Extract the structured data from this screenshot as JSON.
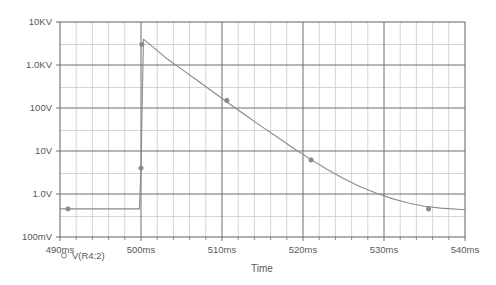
{
  "chart_data": {
    "type": "line",
    "title": "",
    "xlabel": "Time",
    "ylabel": "",
    "yscale": "log",
    "xlim": [
      490,
      540
    ],
    "ylim": [
      0.1,
      10000
    ],
    "grid": true,
    "legend_position": "bottom-left",
    "x_unit": "ms",
    "y_tick_labels": [
      "10KV",
      "1.0KV",
      "100V",
      "10V",
      "1.0V",
      "100mV"
    ],
    "y_tick_values": [
      10000,
      1000,
      100,
      10,
      1,
      0.1
    ],
    "x_tick_labels": [
      "490ms",
      "500ms",
      "510ms",
      "520ms",
      "530ms",
      "540ms"
    ],
    "x_tick_values": [
      490,
      500,
      510,
      520,
      530,
      540
    ],
    "x_minor_step": 2,
    "legend": [
      {
        "label": "V(R4:2)",
        "marker": "circle-open",
        "color": "#8a8a8c"
      }
    ],
    "series": [
      {
        "name": "V(R4:2)",
        "color": "#8a8a8c",
        "x": [
          490.0,
          499.6,
          499.8,
          500.0,
          500.3,
          501.5,
          503.0,
          505.0,
          507.0,
          509.0,
          511.0,
          513.0,
          515.0,
          517.0,
          519.0,
          521.0,
          523.0,
          525.0,
          527.0,
          529.0,
          531.0,
          533.0,
          535.0,
          537.0,
          540.0
        ],
        "y": [
          0.45,
          0.45,
          0.45,
          4.0,
          4000.0,
          2600.0,
          1500.0,
          800.0,
          430.0,
          230.0,
          122.0,
          66.0,
          36.0,
          20.0,
          11.0,
          6.3,
          3.7,
          2.3,
          1.5,
          1.05,
          0.78,
          0.62,
          0.52,
          0.47,
          0.43
        ],
        "markers": [
          {
            "x": 491.0,
            "y": 0.45
          },
          {
            "x": 500.0,
            "y": 4.0
          },
          {
            "x": 500.1,
            "y": 3000.0
          },
          {
            "x": 510.6,
            "y": 150.0
          },
          {
            "x": 521.0,
            "y": 6.2
          },
          {
            "x": 535.5,
            "y": 0.45
          }
        ]
      }
    ]
  },
  "plot": {
    "x_axis_title": "Time",
    "legend_label": "V(R4:2)"
  }
}
